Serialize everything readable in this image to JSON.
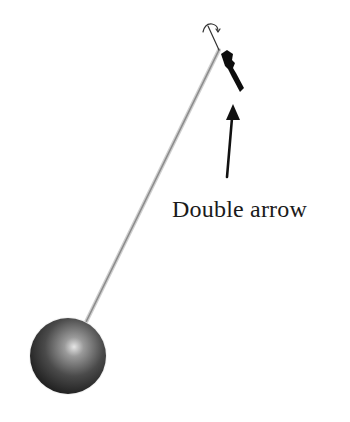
{
  "figure": {
    "annotation_label": "Double arrow",
    "elements": {
      "pendulum_bob": "sphere",
      "pendulum_rod": "thin rod",
      "pivot": "rotation symbol",
      "double_arrow": "dark elongated cursor",
      "annotation_arrow": "pointer arrow"
    }
  },
  "colors": {
    "background": "#ffffff",
    "rod": "#9a9a9a",
    "sphere_dark": "#1c1c1c",
    "sphere_light": "#d9d9d9",
    "double_arrow": "#111111",
    "annotation": "#111111"
  }
}
